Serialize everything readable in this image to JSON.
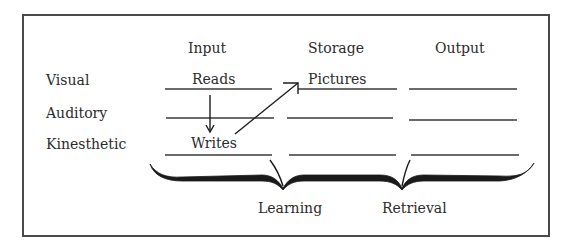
{
  "diagram": {
    "columns": [
      {
        "label": "Input"
      },
      {
        "label": "Storage"
      },
      {
        "label": "Output"
      }
    ],
    "rows": [
      {
        "label": "Visual",
        "cells": [
          "Reads",
          "Pictures",
          ""
        ]
      },
      {
        "label": "Auditory",
        "cells": [
          "",
          "",
          ""
        ]
      },
      {
        "label": "Kinesthetic",
        "cells": [
          "Writes",
          "",
          ""
        ]
      }
    ],
    "arrows": [
      {
        "from": "Reads",
        "to": "Writes",
        "direction": "down"
      },
      {
        "from": "Writes",
        "to": "Pictures",
        "direction": "up-right"
      }
    ],
    "brace_labels": [
      {
        "label": "Learning",
        "spans": [
          "Input",
          "Storage"
        ]
      },
      {
        "label": "Retrieval",
        "spans": [
          "Storage",
          "Output"
        ]
      }
    ]
  }
}
